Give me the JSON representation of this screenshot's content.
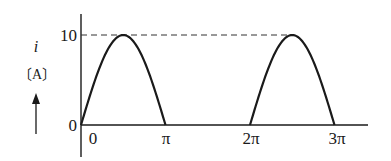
{
  "chart_data": {
    "type": "line",
    "title": "",
    "xlabel": "",
    "ylabel": "i",
    "ylabel_unit": "〔A〕",
    "x_tick_labels": [
      "0",
      "π",
      "2π",
      "3π"
    ],
    "x_ticks": [
      0,
      3.14159,
      6.28319,
      9.42478
    ],
    "y_tick_labels": [
      "0",
      "10"
    ],
    "y_ticks": [
      0,
      10
    ],
    "ylim": [
      0,
      10
    ],
    "xlim": [
      0,
      10.5
    ],
    "grid": false,
    "legend": null,
    "reference_lines": [
      {
        "type": "dashed-horizontal",
        "y": 10,
        "from_x": 0,
        "to_x": 7.854
      }
    ],
    "series": [
      {
        "name": "i",
        "segments": [
          {
            "x": [
              0,
              0.785,
              1.571,
              2.356,
              3.142
            ],
            "y": [
              0,
              7.07,
              10,
              7.07,
              0
            ]
          },
          {
            "x": [
              3.142,
              6.283
            ],
            "y": [
              0,
              0
            ]
          },
          {
            "x": [
              6.283,
              7.069,
              7.854,
              8.639,
              9.425
            ],
            "y": [
              0,
              7.07,
              10,
              7.07,
              0
            ]
          }
        ]
      }
    ],
    "peak_value": 10,
    "origin_label": "0"
  }
}
